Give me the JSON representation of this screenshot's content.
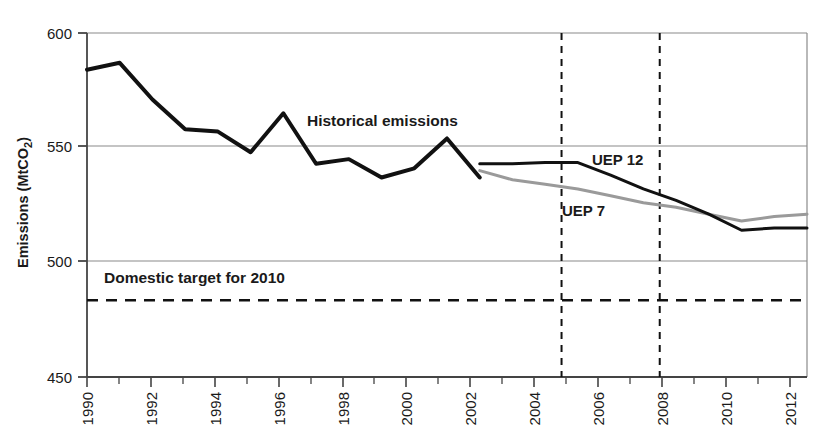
{
  "chart_data": {
    "type": "line",
    "title": "",
    "xlabel": "",
    "ylabel": "Emissions (MtCO2)",
    "ylabel_base": "Emissions (MtCO",
    "ylabel_sub": "2",
    "ylabel_close": ")",
    "xlim": [
      1990,
      2012
    ],
    "ylim": [
      450,
      600
    ],
    "ytick_labels": [
      "600",
      "550",
      "500",
      "450"
    ],
    "ytick_values": [
      600,
      550,
      500,
      450
    ],
    "xtick_labels": [
      "1990",
      "1992",
      "1994",
      "1996",
      "1998",
      "2000",
      "2002",
      "2004",
      "2006",
      "2008",
      "2010",
      "2012"
    ],
    "xtick_values": [
      1990,
      1992,
      1994,
      1996,
      1998,
      2000,
      2002,
      2004,
      2006,
      2008,
      2010,
      2012
    ],
    "xminor_values": [
      1991,
      1993,
      1995,
      1997,
      1999,
      2001,
      2003,
      2005,
      2007,
      2009,
      2011
    ],
    "grid": "horizontal",
    "legend_position": "inline-annotations",
    "series": [
      {
        "name": "Historical emissions",
        "color": "#111111",
        "style": "solid",
        "width": 4.0,
        "x": [
          1990,
          1991,
          1992,
          1993,
          1994,
          1995,
          1996,
          1997,
          1998,
          1999,
          2000,
          2001,
          2002
        ],
        "values": [
          584,
          587,
          571,
          558,
          557,
          548,
          565,
          543,
          545,
          537,
          541,
          554,
          537
        ]
      },
      {
        "name": "UEP 12",
        "color": "#111111",
        "style": "solid",
        "width": 3.0,
        "x": [
          2002,
          2003,
          2004,
          2005,
          2006,
          2007,
          2008,
          2009,
          2010,
          2011,
          2012
        ],
        "values": [
          543,
          543,
          543.5,
          543.5,
          538,
          532,
          527,
          521,
          514,
          515,
          515
        ]
      },
      {
        "name": "UEP 7",
        "color": "#9a9a9a",
        "style": "solid",
        "width": 3.0,
        "x": [
          2002,
          2003,
          2004,
          2005,
          2006,
          2007,
          2008,
          2009,
          2010,
          2011,
          2012
        ],
        "values": [
          540,
          536,
          534,
          532,
          529,
          526,
          524,
          521,
          518,
          520,
          521
        ]
      },
      {
        "name": "Domestic target for 2010",
        "color": "#111111",
        "style": "dashed",
        "width": 2.5,
        "x": [
          1990,
          2012
        ],
        "values": [
          483.5,
          483.5
        ]
      }
    ],
    "vertical_markers": [
      {
        "name": "marker-2004",
        "x": 2004.5,
        "style": "dashed"
      },
      {
        "name": "marker-2007",
        "x": 2007.5,
        "style": "dashed"
      }
    ],
    "annotations": [
      {
        "name": "historical-emissions-label",
        "text": "Historical emissions",
        "x": 2002,
        "y": 0
      },
      {
        "name": "uep12-label",
        "text": "UEP 12",
        "x": 2005.5,
        "y": 0
      },
      {
        "name": "uep7-label",
        "text": "UEP 7",
        "x": 2005.0,
        "y": 0
      },
      {
        "name": "domestic-target-label",
        "text": "Domestic target for 2010",
        "x": 1991,
        "y": 0
      }
    ],
    "labels": {
      "historical": "Historical emissions",
      "uep12": "UEP 12",
      "uep7": "UEP 7",
      "domestic_target": "Domestic target for 2010"
    },
    "colors": {
      "historical": "#111111",
      "uep12": "#111111",
      "uep7": "#9a9a9a",
      "target": "#111111",
      "axis": "#6d6d6d",
      "grid": "#8a8a8a"
    }
  },
  "ytick": {
    "t0": "600",
    "t1": "550",
    "t2": "500",
    "t3": "450"
  },
  "xtick": {
    "t0": "1990",
    "t1": "1992",
    "t2": "1994",
    "t3": "1996",
    "t4": "1998",
    "t5": "2000",
    "t6": "2002",
    "t7": "2004",
    "t8": "2006",
    "t9": "2008",
    "t10": "2010",
    "t11": "2012"
  },
  "axis": {
    "ylabel_base": "Emissions (MtCO",
    "ylabel_sub": "2",
    "ylabel_close": ")"
  },
  "annot": {
    "historical": "Historical emissions",
    "uep12": "UEP 12",
    "uep7": "UEP 7",
    "target": "Domestic target for 2010"
  }
}
